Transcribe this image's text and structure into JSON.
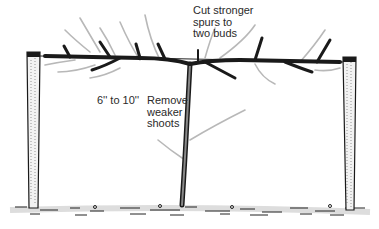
{
  "diagram": {
    "labels": {
      "cut_spurs": "Cut stronger\nspurs to\ntwo buds",
      "height": "6'' to 10''",
      "remove_shoots": "Remove\nweaker\nshoots"
    },
    "colors": {
      "ink": "#1a1a1a",
      "shoot_gray": "#b8b8b8",
      "post_fill": "#f2f2f2",
      "background": "#ffffff"
    }
  }
}
